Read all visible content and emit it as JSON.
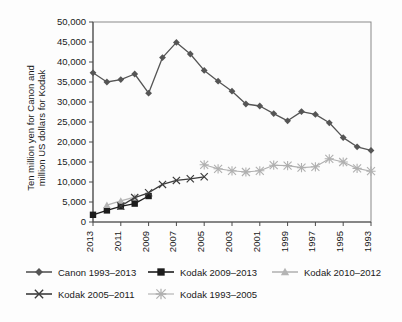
{
  "chart_data": {
    "type": "line",
    "title": "",
    "xlabel": "",
    "ylabel": "Ten million yen for Canon and million US dollars for Kodak",
    "ylim": [
      0,
      50000
    ],
    "ytick_labels": [
      "0",
      "5,000",
      "10,000",
      "15,000",
      "20,000",
      "25,000",
      "30,000",
      "35,000",
      "40,000",
      "45,000",
      "50,000"
    ],
    "ytick_values": [
      0,
      5000,
      10000,
      15000,
      20000,
      25000,
      30000,
      35000,
      40000,
      45000,
      50000
    ],
    "xlim": [
      2013,
      1993
    ],
    "x_axis_reversed": true,
    "xtick_labels": [
      "2013",
      "2011",
      "2009",
      "2007",
      "2005",
      "2003",
      "2001",
      "1999",
      "1997",
      "1995",
      "1993"
    ],
    "xtick_values": [
      2013,
      2011,
      2009,
      2007,
      2005,
      2003,
      2001,
      1999,
      1997,
      1995,
      1993
    ],
    "grid": false,
    "legend_position": "bottom",
    "series": [
      {
        "name": "Canon 1993–2013",
        "marker": "diamond",
        "color": "#555555",
        "x": [
          2013,
          2012,
          2011,
          2010,
          2009,
          2008,
          2007,
          2006,
          2005,
          2004,
          2003,
          2002,
          2001,
          2000,
          1999,
          1998,
          1997,
          1996,
          1995,
          1994,
          1993
        ],
        "values": [
          37300,
          35000,
          35600,
          37000,
          32200,
          41100,
          44900,
          42000,
          37900,
          35200,
          32700,
          29500,
          29000,
          27100,
          25300,
          27600,
          26900,
          24800,
          21100,
          18800,
          17900
        ]
      },
      {
        "name": "Kodak 2009–2013",
        "marker": "square",
        "color": "#1c1c1c",
        "x": [
          2013,
          2012,
          2011,
          2010,
          2009
        ],
        "values": [
          1800,
          2900,
          3900,
          4600,
          6500
        ]
      },
      {
        "name": "Kodak 2010–2012",
        "marker": "triangle",
        "color": "#b4b4b4",
        "x": [
          2012,
          2011,
          2010
        ],
        "values": [
          4200,
          5300,
          6200
        ]
      },
      {
        "name": "Kodak 2005–2011",
        "marker": "x",
        "color": "#3c3c3c",
        "x": [
          2011,
          2010,
          2009,
          2008,
          2007,
          2006,
          2005
        ],
        "values": [
          4000,
          6100,
          7300,
          9400,
          10400,
          10800,
          11300
        ]
      },
      {
        "name": "Kodak 1993–2005",
        "marker": "asterisk",
        "color": "#b0b0b0",
        "x": [
          2005,
          2004,
          2003,
          2002,
          2001,
          2000,
          1999,
          1998,
          1997,
          1996,
          1995,
          1994,
          1993
        ],
        "values": [
          14300,
          13300,
          12800,
          12500,
          12800,
          14200,
          14100,
          13600,
          13800,
          15800,
          15000,
          13400,
          12700
        ]
      }
    ]
  },
  "legend": {
    "items": [
      {
        "label": "Canon 1993–2013"
      },
      {
        "label": "Kodak 2009–2013"
      },
      {
        "label": "Kodak 2010–2012"
      },
      {
        "label": "Kodak 2005–2011"
      },
      {
        "label": "Kodak 1993–2005"
      }
    ]
  },
  "axis": {
    "y_title_line1": "Ten million yen for Canon and",
    "y_title_line2": "million US dollars for Kodak"
  }
}
